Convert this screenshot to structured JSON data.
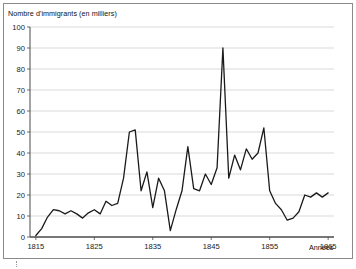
{
  "figure": {
    "background_color": "#ffffff",
    "frame_color": "#8a8a8a",
    "crop_mark": "crop-mark"
  },
  "chart_data": {
    "type": "line",
    "title": "Nombre d'immigrants (en milliers)",
    "xlabel": "Années",
    "ylabel": "Nombre d'immigrants (en milliers)",
    "xlim": [
      1814,
      1866
    ],
    "ylim": [
      0,
      100
    ],
    "ytick_step": 10,
    "yticks": [
      0,
      10,
      20,
      30,
      40,
      50,
      60,
      70,
      80,
      90,
      100
    ],
    "ytick_labels": [
      "0",
      "10",
      "20",
      "30",
      "40",
      "50",
      "60",
      "70",
      "80",
      "90",
      "100"
    ],
    "xticks": [
      1815,
      1825,
      1835,
      1845,
      1855,
      1865
    ],
    "xtick_labels": [
      "1815",
      "1825",
      "1835",
      "1845",
      "1855",
      "1865"
    ],
    "grid": "horizontal",
    "grid_color": "#c9c9c9",
    "legend": "none",
    "line_color": "#1a1a1a",
    "line_width": 1.3,
    "x": [
      1815,
      1816,
      1817,
      1818,
      1819,
      1820,
      1821,
      1822,
      1823,
      1824,
      1825,
      1826,
      1827,
      1828,
      1829,
      1830,
      1831,
      1832,
      1833,
      1834,
      1835,
      1836,
      1837,
      1838,
      1839,
      1840,
      1841,
      1842,
      1843,
      1844,
      1845,
      1846,
      1847,
      1848,
      1849,
      1850,
      1851,
      1852,
      1853,
      1854,
      1855,
      1856,
      1857,
      1858,
      1859,
      1860,
      1861,
      1862,
      1863,
      1864,
      1865
    ],
    "values": [
      0.7,
      4,
      9.5,
      13,
      12.5,
      11,
      12.5,
      11,
      9,
      11.5,
      13,
      11,
      17,
      15,
      16,
      28,
      50,
      51,
      22,
      31,
      14,
      28,
      22,
      3,
      13,
      22,
      43,
      23,
      22,
      30,
      25,
      33,
      90,
      28,
      39,
      32,
      42,
      37,
      40,
      52,
      22,
      16,
      13,
      8,
      9,
      12,
      20,
      19,
      21,
      19,
      21
    ],
    "annotations": {
      "peak_1832": 51,
      "peak_1847": 90,
      "peak_1854": 52,
      "trough_1838": 3
    }
  }
}
